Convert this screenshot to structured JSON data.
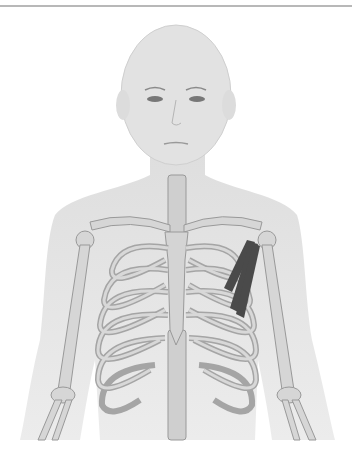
{
  "figure": {
    "highlighted_structure": "pectoralis minor (left side of image, right of body)",
    "colors": {
      "background": "#ffffff",
      "skin": "#e4e4e4",
      "bone": "#d2d2d2",
      "bone_outline": "#9a9a9a",
      "muscle": "#4a4a4a",
      "top_rule": "#b8b8b8"
    }
  }
}
